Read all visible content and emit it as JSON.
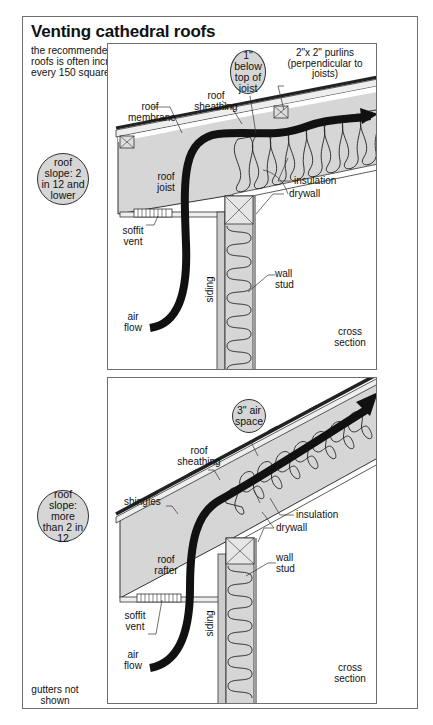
{
  "title": "Venting cathedral roofs",
  "intro": "the recommended vent area for cathedral roofs is often increased to 1 square foot for every 150 square feet of roof area",
  "colors": {
    "frame": "#6e6e6e",
    "fill_gray": "#d6d6d6",
    "airflow": "#111111",
    "line": "#222222"
  },
  "panel1": {
    "slope_badge": "roof slope: 2 in 12 and lower",
    "callout_bubble": "1\" below top of joist",
    "labels": {
      "roof_membrane": "roof membrane",
      "roof_sheathing": "roof sheathing",
      "purlins": "2\"x 2\" purlins (perpendicular to joists)",
      "roof_member": "roof joist",
      "insulation": "insulation",
      "drywall": "drywall",
      "soffit_vent": "soffit vent",
      "siding": "siding",
      "wall_stud": "wall stud",
      "air_flow": "air flow",
      "cross_section": "cross section"
    }
  },
  "panel2": {
    "slope_badge": "roof slope: more than 2 in 12",
    "callout_bubble": "3\" air space",
    "labels": {
      "shingles": "shingles",
      "roof_sheathing": "roof sheathing",
      "roof_member": "roof rafter",
      "insulation": "insulation",
      "drywall": "drywall",
      "soffit_vent": "soffit vent",
      "siding": "siding",
      "wall_stud": "wall stud",
      "air_flow": "air flow",
      "cross_section": "cross section"
    }
  },
  "footnote": "gutters not shown"
}
